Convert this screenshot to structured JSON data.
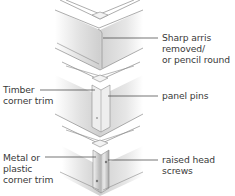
{
  "diagram": {
    "panels": [
      {
        "id": "arris",
        "method": "Sharp arris removed / or pencil round"
      },
      {
        "id": "timber-trim",
        "method": "Timber corner trim fixed with panel pins"
      },
      {
        "id": "metal-trim",
        "method": "Metal or plastic corner trim fixed with raised head screws"
      }
    ],
    "labels": {
      "arris": "Sharp arris\nremoved/\nor pencil round",
      "timber_trim": "Timber\ncorner trim",
      "panel_pins": "panel pins",
      "metal_trim": "Metal or\nplastic\ncorner trim",
      "raised_screws": "raised head\nscrews"
    },
    "colors": {
      "text": "#3a3a3a",
      "leader": "#3a3a3a",
      "outline": "#8a8a8a",
      "face_light": "#f2f2f2",
      "face_mid": "#d9d9d9",
      "face_dark": "#bdbdbd",
      "metal": "#c7c7c7"
    }
  }
}
